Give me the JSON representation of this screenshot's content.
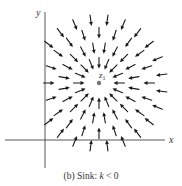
{
  "figure": {
    "caption_prefix": "(b) Sink: ",
    "caption_var": "k",
    "caption_suffix": " < 0",
    "x_axis_label": "x",
    "y_axis_label": "y",
    "point_label": "z",
    "point_subscript": "1"
  },
  "diagram": {
    "type": "vector-field",
    "center": {
      "x": 99,
      "y": 83
    },
    "axes": {
      "x_axis": {
        "y": 140,
        "x_start": 5,
        "x_end": 165
      },
      "y_axis": {
        "x": 45,
        "y_start": 12,
        "y_end": 168
      }
    },
    "arrow_length": 11,
    "rings": [
      {
        "radius": 20,
        "count": 16,
        "offset_deg": 0
      },
      {
        "radius": 35,
        "count": 20,
        "offset_deg": 9
      },
      {
        "radius": 50,
        "count": 20,
        "offset_deg": 0
      },
      {
        "radius": 63,
        "count": 24,
        "offset_deg": 7.5
      }
    ],
    "colors": {
      "arrow": "#1a1a1a",
      "axis": "#444444",
      "center_point": "#777777"
    }
  }
}
